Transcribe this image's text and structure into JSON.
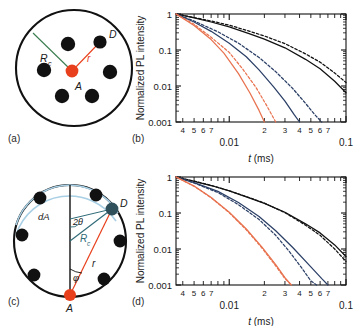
{
  "figure": {
    "panels": [
      {
        "id": "a",
        "label": "(a)"
      },
      {
        "id": "b",
        "label": "(b)"
      },
      {
        "id": "c",
        "label": "(c)"
      },
      {
        "id": "d",
        "label": "(d)"
      }
    ]
  },
  "schematic_a": {
    "label": "(a)",
    "acceptor_label": "A",
    "donor_label": "D",
    "radius_label": "R",
    "radius_sub": "c",
    "distance_label": "r",
    "colors": {
      "acceptor": "#e8401c",
      "donor": "#111111",
      "circle": "#111111",
      "Rc_line": "#3a7d4f",
      "r_line": "#e8401c"
    },
    "donors": [
      {
        "cx": 68,
        "cy": 44
      },
      {
        "cx": 100,
        "cy": 42
      },
      {
        "cx": 44,
        "cy": 70
      },
      {
        "cx": 110,
        "cy": 72
      },
      {
        "cx": 62,
        "cy": 96
      },
      {
        "cx": 92,
        "cy": 96
      }
    ],
    "acceptor": {
      "cx": 72,
      "cy": 71
    },
    "circle": {
      "cx": 74,
      "cy": 68,
      "r": 58
    }
  },
  "schematic_c": {
    "label": "(c)",
    "acceptor_label": "A",
    "donor_label": "D",
    "area_label": "dA",
    "angle_label": "2θ",
    "phi_label": "φ",
    "radius_label": "R",
    "radius_sub": "c",
    "distance_label": "r",
    "colors": {
      "acceptor": "#e8401c",
      "donor": "#111111",
      "circle": "#111111",
      "arc": "#a8cfe4",
      "Rc_line": "#2f6b78",
      "r_line": "#e8401c",
      "axis": "#111111"
    },
    "circle": {
      "cx": 70,
      "cy": 78,
      "r": 56
    },
    "acceptor": {
      "cx": 70,
      "cy": 132
    },
    "donor": {
      "cx": 112,
      "cy": 46
    },
    "perimeter_donors": [
      {
        "cx": 40,
        "cy": 35
      },
      {
        "cx": 96,
        "cy": 32
      },
      {
        "cx": 22,
        "cy": 72
      },
      {
        "cx": 120,
        "cy": 78
      },
      {
        "cx": 34,
        "cy": 112
      },
      {
        "cx": 104,
        "cy": 116
      }
    ]
  },
  "chart_b": {
    "type": "line",
    "label": "(b)",
    "xlabel": "t (ms)",
    "ylabel": "Normalized PL intensity",
    "xscale": "log",
    "yscale": "log",
    "xlim": [
      0.0035,
      0.1
    ],
    "ylim": [
      0.001,
      1
    ],
    "xtick_major": [
      0.01,
      0.1
    ],
    "xtick_major_labels": [
      "0.01",
      "0.1"
    ],
    "xtick_minor": [
      0.004,
      0.005,
      0.006,
      0.007,
      0.02,
      0.03,
      0.04,
      0.05,
      0.06,
      0.07
    ],
    "xtick_minor_labels": [
      "4",
      "5",
      "6",
      "7",
      "2",
      "3",
      "4",
      "5",
      "6",
      "7"
    ],
    "ytick_major": [
      1,
      0.1,
      0.01,
      0.001
    ],
    "ytick_major_labels": [
      "1",
      "0.1",
      "0.01",
      "0.001"
    ],
    "grid": false,
    "legend": "none",
    "series": [
      {
        "name": "black-solid",
        "color": "#111111",
        "style": "solid",
        "x": [
          0.0035,
          0.005,
          0.007,
          0.01,
          0.015,
          0.02,
          0.03,
          0.045,
          0.06,
          0.08,
          0.1
        ],
        "y": [
          1.0,
          0.78,
          0.6,
          0.44,
          0.28,
          0.2,
          0.115,
          0.055,
          0.03,
          0.0135,
          0.0065
        ]
      },
      {
        "name": "black-dashed",
        "color": "#111111",
        "style": "dashed",
        "x": [
          0.0035,
          0.005,
          0.007,
          0.01,
          0.015,
          0.02,
          0.03,
          0.045,
          0.06,
          0.08,
          0.1
        ],
        "y": [
          1.0,
          0.8,
          0.64,
          0.49,
          0.33,
          0.245,
          0.15,
          0.078,
          0.046,
          0.023,
          0.0125
        ]
      },
      {
        "name": "blue-solid",
        "color": "#2b3f66",
        "style": "solid",
        "x": [
          0.0035,
          0.005,
          0.007,
          0.01,
          0.014,
          0.018,
          0.024,
          0.03,
          0.036,
          0.04
        ],
        "y": [
          1.0,
          0.6,
          0.33,
          0.155,
          0.065,
          0.028,
          0.0095,
          0.0038,
          0.0016,
          0.001
        ]
      },
      {
        "name": "blue-dashed",
        "color": "#2b3f66",
        "style": "dashed",
        "x": [
          0.0035,
          0.005,
          0.008,
          0.012,
          0.018,
          0.025,
          0.035,
          0.045,
          0.055,
          0.062
        ],
        "y": [
          1.0,
          0.64,
          0.32,
          0.155,
          0.062,
          0.025,
          0.0085,
          0.0033,
          0.0015,
          0.001
        ]
      },
      {
        "name": "red-solid",
        "color": "#e8724f",
        "style": "solid",
        "x": [
          0.0035,
          0.005,
          0.007,
          0.009,
          0.012,
          0.015,
          0.018,
          0.02
        ],
        "y": [
          1.0,
          0.48,
          0.195,
          0.082,
          0.022,
          0.0065,
          0.0021,
          0.001
        ]
      },
      {
        "name": "red-dashed",
        "color": "#e8724f",
        "style": "dashed",
        "x": [
          0.0035,
          0.005,
          0.007,
          0.01,
          0.013,
          0.017,
          0.021,
          0.025
        ],
        "y": [
          1.0,
          0.52,
          0.225,
          0.086,
          0.03,
          0.009,
          0.0028,
          0.001
        ]
      }
    ]
  },
  "chart_d": {
    "type": "line",
    "label": "(d)",
    "xlabel": "t (ms)",
    "ylabel": "Normalized PL intensity",
    "xscale": "log",
    "yscale": "log",
    "xlim": [
      0.0035,
      0.1
    ],
    "ylim": [
      0.001,
      1
    ],
    "xtick_major": [
      0.01,
      0.1
    ],
    "xtick_major_labels": [
      "0.01",
      "0.1"
    ],
    "xtick_minor": [
      0.004,
      0.005,
      0.006,
      0.007,
      0.02,
      0.03,
      0.04,
      0.05,
      0.06,
      0.07
    ],
    "xtick_minor_labels": [
      "4",
      "5",
      "6",
      "7",
      "2",
      "3",
      "4",
      "5",
      "6",
      "7"
    ],
    "ytick_major": [
      1,
      0.1,
      0.01,
      0.001
    ],
    "ytick_major_labels": [
      "1",
      "0.1",
      "0.01",
      "0.001"
    ],
    "grid": false,
    "legend": "none",
    "series": [
      {
        "name": "black-solid",
        "color": "#111111",
        "style": "solid",
        "x": [
          0.0035,
          0.005,
          0.007,
          0.01,
          0.015,
          0.02,
          0.03,
          0.045,
          0.06,
          0.08,
          0.1
        ],
        "y": [
          1.0,
          0.76,
          0.58,
          0.41,
          0.26,
          0.185,
          0.105,
          0.05,
          0.028,
          0.013,
          0.0062
        ]
      },
      {
        "name": "black-dashed",
        "color": "#111111",
        "style": "dashed",
        "x": [
          0.0035,
          0.005,
          0.007,
          0.01,
          0.015,
          0.02,
          0.03,
          0.045,
          0.06,
          0.08,
          0.1
        ],
        "y": [
          1.0,
          0.77,
          0.585,
          0.415,
          0.265,
          0.188,
          0.102,
          0.046,
          0.024,
          0.01,
          0.0045
        ]
      },
      {
        "name": "blue-solid",
        "color": "#2b3f66",
        "style": "solid",
        "x": [
          0.0035,
          0.005,
          0.008,
          0.012,
          0.018,
          0.025,
          0.035,
          0.05,
          0.062,
          0.07
        ],
        "y": [
          1.0,
          0.7,
          0.4,
          0.195,
          0.08,
          0.032,
          0.011,
          0.0032,
          0.0015,
          0.001
        ]
      },
      {
        "name": "blue-dashed",
        "color": "#2b3f66",
        "style": "dashed",
        "x": [
          0.0035,
          0.005,
          0.008,
          0.012,
          0.018,
          0.025,
          0.033,
          0.042,
          0.05,
          0.056
        ],
        "y": [
          1.0,
          0.68,
          0.37,
          0.17,
          0.066,
          0.024,
          0.0082,
          0.0029,
          0.0013,
          0.001
        ]
      },
      {
        "name": "red-solid",
        "color": "#e8724f",
        "style": "solid",
        "x": [
          0.0035,
          0.005,
          0.007,
          0.01,
          0.014,
          0.019,
          0.025,
          0.03,
          0.034
        ],
        "y": [
          1.0,
          0.56,
          0.27,
          0.105,
          0.036,
          0.0115,
          0.0037,
          0.0016,
          0.001
        ]
      },
      {
        "name": "red-dashed",
        "color": "#e8724f",
        "style": "dashed",
        "x": [
          0.0035,
          0.005,
          0.007,
          0.01,
          0.014,
          0.019,
          0.025,
          0.03,
          0.034
        ],
        "y": [
          1.0,
          0.555,
          0.265,
          0.102,
          0.034,
          0.0108,
          0.0034,
          0.0015,
          0.001
        ]
      }
    ]
  }
}
